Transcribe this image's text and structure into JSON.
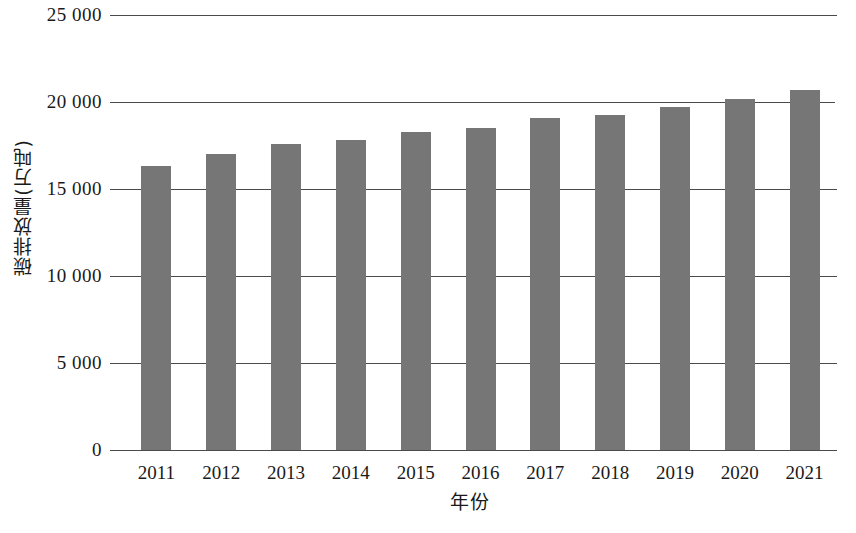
{
  "chart_data": {
    "type": "bar",
    "title": "",
    "subtitle": "",
    "xlabel": "年份",
    "ylabel": "碳排放量(万吨)",
    "categories": [
      "2011",
      "2012",
      "2013",
      "2014",
      "2015",
      "2016",
      "2017",
      "2018",
      "2019",
      "2020",
      "2021"
    ],
    "values": [
      16300,
      17000,
      17600,
      17800,
      18300,
      18500,
      19100,
      19250,
      19700,
      20200,
      20700
    ],
    "series": [
      {
        "name": "碳排放量",
        "values": [
          16300,
          17000,
          17600,
          17800,
          18300,
          18500,
          19100,
          19250,
          19700,
          20200,
          20700
        ]
      }
    ],
    "ylim": [
      0,
      25000
    ],
    "ytick_values": [
      0,
      5000,
      10000,
      15000,
      20000,
      25000
    ],
    "ytick_labels": [
      "0",
      "5 000",
      "10 000",
      "15 000",
      "20 000",
      "25 000"
    ],
    "grid": true,
    "legend": "none",
    "bar_color": "#767676",
    "axis_color": "#4a4a4a",
    "text_color": "#1a1a1a",
    "background": "#ffffff"
  }
}
